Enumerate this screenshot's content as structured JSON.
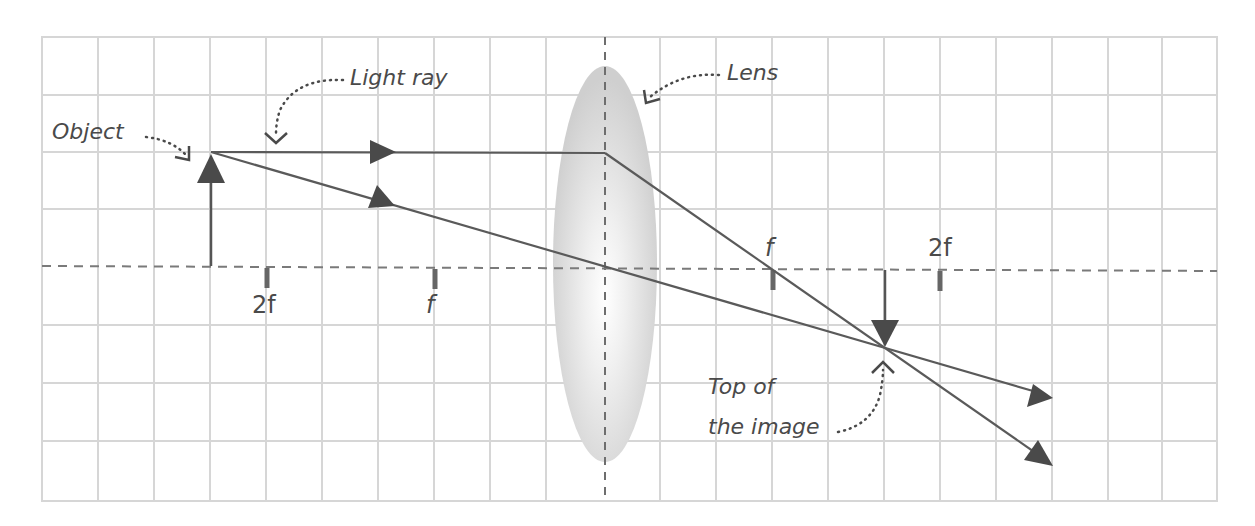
{
  "diagram": {
    "labels": {
      "object": "Object",
      "light_ray": "Light ray",
      "lens": "Lens",
      "image_line1": "Top of",
      "image_line2": "the image"
    },
    "ticks": [
      {
        "label": "2f",
        "x": 267,
        "side": "left"
      },
      {
        "label": "f",
        "x": 435,
        "side": "left"
      },
      {
        "label": "f",
        "x": 773,
        "side": "right"
      },
      {
        "label": "2f",
        "x": 940,
        "side": "right"
      }
    ],
    "colors": {
      "grid": "#d6d6d6",
      "axis": "#7a7a7a",
      "ray": "#5a5a5a",
      "arrow": "#4a4a4a",
      "lens": "#d0d0d0",
      "text": "#4a4a4a"
    },
    "grid": {
      "x0": 42,
      "y0": 37,
      "x1": 1217,
      "y1": 501,
      "cols": 21,
      "rows": 8
    },
    "optical_axis_y": 268,
    "lens": {
      "cx": 605,
      "cy": 264,
      "rx": 52,
      "ry": 198
    },
    "object_arrow": {
      "x": 211,
      "base_y": 266,
      "tip_y": 152
    },
    "image_arrow": {
      "x": 885,
      "base_y": 270,
      "tip_y": 348
    }
  }
}
